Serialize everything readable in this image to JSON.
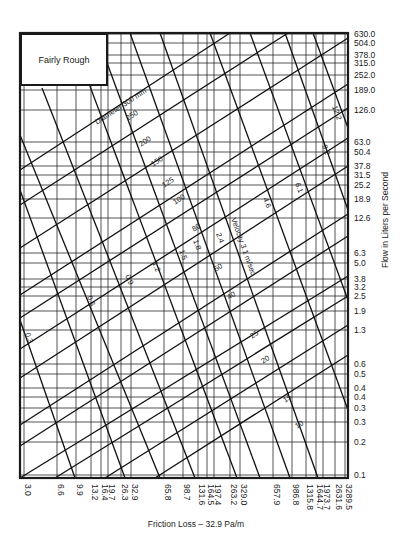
{
  "chart_data": {
    "type": "line",
    "title": "Fairly Rough",
    "xlabel": "Friction Loss – 32.9 Pa/m",
    "ylabel": "Flow in Liters per Second",
    "x_scale": "log",
    "y_scale": "log",
    "xlim": [
      3.0,
      3289.5
    ],
    "ylim": [
      0.1,
      630.0
    ],
    "grid": true,
    "x_ticks": [
      "3.0",
      "6.6",
      "9.9",
      "13.2",
      "16.4",
      "19.7",
      "26.3",
      "32.9",
      "65.8",
      "98.7",
      "131.6",
      "164.5",
      "197.4",
      "263.2",
      "329.0",
      "657.9",
      "986.8",
      "1315.8",
      "1644.7",
      "1973.7",
      "2631.6",
      "3289.5"
    ],
    "y_ticks": [
      "630.0",
      "504.0",
      "378.0",
      "315.0",
      "252.0",
      "189.0",
      "126.0",
      "63.0",
      "50.4",
      "37.8",
      "31.5",
      "25.2",
      "18.9",
      "12.6",
      "6.3",
      "5.0",
      "3.8",
      "3.2",
      "2.5",
      "1.9",
      "1.3",
      "0.6",
      "0.5",
      "0.4",
      "0.4",
      "0.3",
      "0.3",
      "0.2",
      "0.1"
    ],
    "diameter_lines_mm": [
      "300",
      "250",
      "200",
      "150",
      "125",
      "100",
      "80",
      "50",
      "40",
      "25",
      "20",
      "15",
      "10"
    ],
    "diameter_label_prefix": "Diameter",
    "diameter_label_unit": "mm",
    "velocity_lines_m_per_sec": [
      "0.3",
      "0.6",
      "0.9",
      "1.2",
      "1.5",
      "1.8",
      "2.4",
      "3.1",
      "4.6",
      "6.1",
      "9.2",
      "12.2"
    ],
    "velocity_label_prefix": "Velocity",
    "velocity_label_unit": "m/sec"
  },
  "legend_box": {
    "label": "Fairly Rough"
  },
  "axes": {
    "x_title": "Friction Loss – 32.9 Pa/m",
    "y_title": "Flow in Liters per Second",
    "x_ticks": [
      {
        "label": "3.0",
        "x": 24
      },
      {
        "label": "6.6",
        "x": 57
      },
      {
        "label": "9.9",
        "x": 76
      },
      {
        "label": "13.2",
        "x": 91
      },
      {
        "label": "16.4",
        "x": 101
      },
      {
        "label": "19.7",
        "x": 108
      },
      {
        "label": "26.3",
        "x": 121
      },
      {
        "label": "32.9",
        "x": 131
      },
      {
        "label": "65.8",
        "x": 164
      },
      {
        "label": "98.7",
        "x": 183
      },
      {
        "label": "131.6",
        "x": 198
      },
      {
        "label": "164.5",
        "x": 207
      },
      {
        "label": "197.4",
        "x": 214
      },
      {
        "label": "263.2",
        "x": 230
      },
      {
        "label": "329.0",
        "x": 240
      },
      {
        "label": "657.9",
        "x": 273
      },
      {
        "label": "986.8",
        "x": 292
      },
      {
        "label": "1315.8",
        "x": 306
      },
      {
        "label": "1644.7",
        "x": 316
      },
      {
        "label": "1973.7",
        "x": 323
      },
      {
        "label": "2631.6",
        "x": 335
      },
      {
        "label": "3289.5",
        "x": 345
      }
    ],
    "y_ticks": [
      {
        "label": "630.0",
        "y": 34
      },
      {
        "label": "504.0",
        "y": 43
      },
      {
        "label": "378.0",
        "y": 55
      },
      {
        "label": "315.0",
        "y": 63
      },
      {
        "label": "252.0",
        "y": 75
      },
      {
        "label": "189.0",
        "y": 90
      },
      {
        "label": "126.0",
        "y": 110
      },
      {
        "label": "63.0",
        "y": 142
      },
      {
        "label": "50.4",
        "y": 152
      },
      {
        "label": "37.8",
        "y": 166
      },
      {
        "label": "31.5",
        "y": 175
      },
      {
        "label": "25.2",
        "y": 185
      },
      {
        "label": "18.9",
        "y": 199
      },
      {
        "label": "12.6",
        "y": 218
      },
      {
        "label": "6.3",
        "y": 253
      },
      {
        "label": "5.0",
        "y": 263
      },
      {
        "label": "3.8",
        "y": 279
      },
      {
        "label": "3.2",
        "y": 287
      },
      {
        "label": "2.5",
        "y": 296
      },
      {
        "label": "1.9",
        "y": 311
      },
      {
        "label": "1.3",
        "y": 330
      },
      {
        "label": "0.6",
        "y": 364
      },
      {
        "label": "0.5",
        "y": 374
      },
      {
        "label": "0.4",
        "y": 388
      },
      {
        "label": "0.4",
        "y": 397
      },
      {
        "label": "0.3",
        "y": 408
      },
      {
        "label": "0.3",
        "y": 422
      },
      {
        "label": "0.2",
        "y": 442
      },
      {
        "label": "0.1",
        "y": 475
      }
    ]
  },
  "diameter_lines": [
    {
      "label": "Diameter 300 mm",
      "x1": 20,
      "y1": 170,
      "x2": 230,
      "y2": 33,
      "lx": 96,
      "ly": 123
    },
    {
      "label": "250",
      "x1": 20,
      "y1": 205,
      "x2": 288,
      "y2": 33,
      "lx": 127,
      "ly": 119
    },
    {
      "label": "200",
      "x1": 20,
      "y1": 248,
      "x2": 348,
      "y2": 38,
      "lx": 140,
      "ly": 145
    },
    {
      "label": "150",
      "x1": 20,
      "y1": 295,
      "x2": 348,
      "y2": 84,
      "lx": 152,
      "ly": 165
    },
    {
      "label": "125",
      "x1": 20,
      "y1": 318,
      "x2": 348,
      "y2": 108,
      "lx": 163,
      "ly": 186
    },
    {
      "label": "100",
      "x1": 20,
      "y1": 349,
      "x2": 348,
      "y2": 138,
      "lx": 174,
      "ly": 203
    },
    {
      "label": "80",
      "x1": 20,
      "y1": 378,
      "x2": 348,
      "y2": 166,
      "lx": 193,
      "ly": 230
    },
    {
      "label": "50",
      "x1": 20,
      "y1": 425,
      "x2": 348,
      "y2": 214,
      "lx": 215,
      "ly": 270
    },
    {
      "label": "40",
      "x1": 20,
      "y1": 446,
      "x2": 348,
      "y2": 236,
      "lx": 228,
      "ly": 298
    },
    {
      "label": "25",
      "x1": 20,
      "y1": 478,
      "x2": 348,
      "y2": 276,
      "lx": 251,
      "ly": 337
    },
    {
      "label": "20",
      "x1": 55,
      "y1": 478,
      "x2": 348,
      "y2": 296,
      "lx": 262,
      "ly": 362
    },
    {
      "label": "15",
      "x1": 105,
      "y1": 478,
      "x2": 348,
      "y2": 325,
      "lx": 284,
      "ly": 401
    },
    {
      "label": "10",
      "x1": 155,
      "y1": 478,
      "x2": 348,
      "y2": 355,
      "lx": 296,
      "ly": 427
    }
  ],
  "velocity_lines": [
    {
      "label": "0.3",
      "x1": 20,
      "y1": 320,
      "x2": 75,
      "y2": 478,
      "lx": 27,
      "ly": 333
    },
    {
      "label": "0.6",
      "x1": 20,
      "y1": 190,
      "x2": 125,
      "y2": 478,
      "lx": 89,
      "ly": 296
    },
    {
      "label": "0.9",
      "x1": 20,
      "y1": 135,
      "x2": 160,
      "y2": 478,
      "lx": 127,
      "ly": 275
    },
    {
      "label": "1.2",
      "x1": 42,
      "y1": 88,
      "x2": 195,
      "y2": 478,
      "lx": 154,
      "ly": 262
    },
    {
      "label": "1.5",
      "x1": 70,
      "y1": 33,
      "x2": 237,
      "y2": 478,
      "lx": 181,
      "ly": 250
    },
    {
      "label": "1.8",
      "x1": 96,
      "y1": 33,
      "x2": 260,
      "y2": 478,
      "lx": 195,
      "ly": 240
    },
    {
      "label": "2.4",
      "x1": 130,
      "y1": 33,
      "x2": 290,
      "y2": 478,
      "lx": 218,
      "ly": 233
    },
    {
      "label": "Velocity 3.1 m/sec",
      "x1": 160,
      "y1": 33,
      "x2": 318,
      "y2": 478,
      "lx": 233,
      "ly": 218
    },
    {
      "label": "4.6",
      "x1": 210,
      "y1": 33,
      "x2": 348,
      "y2": 410,
      "lx": 265,
      "ly": 198
    },
    {
      "label": "6.1",
      "x1": 250,
      "y1": 33,
      "x2": 348,
      "y2": 300,
      "lx": 297,
      "ly": 183
    },
    {
      "label": "9.2",
      "x1": 285,
      "y1": 33,
      "x2": 348,
      "y2": 210,
      "lx": 324,
      "ly": 145
    },
    {
      "label": "12.2",
      "x1": 313,
      "y1": 33,
      "x2": 348,
      "y2": 128,
      "lx": 334,
      "ly": 106
    }
  ],
  "frame": {
    "left": 20,
    "top": 33,
    "right": 348,
    "bottom": 478
  }
}
